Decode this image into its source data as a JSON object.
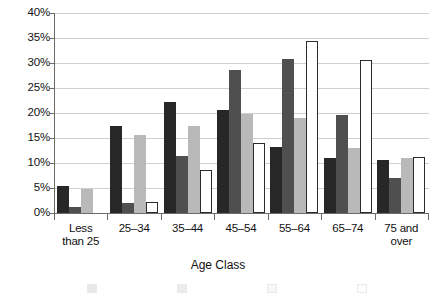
{
  "chart_data": {
    "type": "bar",
    "title": "",
    "xlabel": "Age Class",
    "ylabel": "",
    "ylim": [
      0,
      40
    ],
    "ytick_labels": [
      "40%",
      "35%",
      "30%",
      "25%",
      "20%",
      "15%",
      "10%",
      "5%",
      "0%"
    ],
    "ytick_values": [
      40,
      35,
      30,
      25,
      20,
      15,
      10,
      5,
      0
    ],
    "grid": true,
    "legend_position": "bottom",
    "categories": [
      "Less than 25",
      "25–34",
      "35–44",
      "45–54",
      "55–64",
      "65–74",
      "75 and over"
    ],
    "category_lines": [
      [
        "Less",
        "than 25"
      ],
      [
        "25–34",
        ""
      ],
      [
        "35–44",
        ""
      ],
      [
        "45–54",
        ""
      ],
      [
        "55–64",
        ""
      ],
      [
        "65–74",
        ""
      ],
      [
        "75 and",
        "over"
      ]
    ],
    "series": [
      {
        "name": "Series 1",
        "color": "#272727",
        "values": [
          5.5,
          17.4,
          22.2,
          20.6,
          13.3,
          11.0,
          10.7
        ]
      },
      {
        "name": "Series 2",
        "color": "#4f4f4f",
        "values": [
          1.3,
          2.0,
          11.5,
          28.6,
          30.8,
          19.6,
          7.0
        ]
      },
      {
        "name": "Series 3",
        "color": "#b9b9b9",
        "values": [
          4.9,
          15.7,
          17.5,
          19.9,
          19.0,
          13.0,
          11.1
        ]
      },
      {
        "name": "Series 4",
        "color": "#ffffff",
        "values": [
          0.0,
          2.3,
          8.6,
          14.0,
          34.5,
          30.7,
          11.2
        ]
      }
    ]
  },
  "legend": {
    "items": [
      {
        "label": "",
        "color": "#272727"
      },
      {
        "label": "",
        "color": "#4f4f4f"
      },
      {
        "label": "",
        "color": "#b9b9b9"
      },
      {
        "label": "",
        "color": "#ffffff"
      }
    ]
  }
}
